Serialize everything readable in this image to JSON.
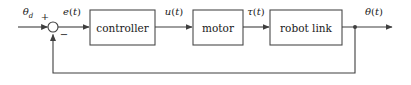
{
  "diagram": {
    "type": "block-diagram",
    "colors": {
      "background": "#ffffff",
      "line": "#3f3f3f",
      "block_border": "#4a4a4a",
      "text": "#1a1a1a"
    },
    "blocks": [
      {
        "id": "controller",
        "label": "controller",
        "x": 90,
        "y": 10,
        "w": 65,
        "h": 35
      },
      {
        "id": "motor",
        "label": "motor",
        "x": 193,
        "y": 10,
        "w": 50,
        "h": 35
      },
      {
        "id": "robot-link",
        "label": "robot link",
        "x": 270,
        "y": 10,
        "w": 72,
        "h": 35
      }
    ],
    "summing_junction": {
      "id": "summing-junction",
      "cx": 53,
      "cy": 27,
      "r": 5,
      "plus_sign": "+",
      "minus_sign": "−"
    },
    "signals": {
      "reference": {
        "symbol": "θ",
        "subscript": "d",
        "label": "θd",
        "x": 28,
        "y": 12
      },
      "error": {
        "symbol": "e",
        "arg": "(t)",
        "label": "e(t)",
        "x": 72,
        "y": 12
      },
      "control": {
        "symbol": "u",
        "arg": "(t)",
        "label": "u(t)",
        "x": 174,
        "y": 12
      },
      "torque": {
        "symbol": "τ",
        "arg": "(t)",
        "label": "τ(t)",
        "x": 256,
        "y": 12
      },
      "output": {
        "symbol": "θ",
        "arg": "(t)",
        "label": "θ(t)",
        "x": 374,
        "y": 12
      }
    },
    "feedback": {
      "tap_x": 355,
      "bottom_y": 73,
      "return_x": 53,
      "description": "output fed back to negative input of summing junction"
    },
    "wires": {
      "input_start_x": 18,
      "main_y": 27,
      "output_end_x": 393
    }
  }
}
